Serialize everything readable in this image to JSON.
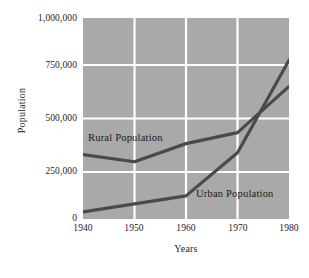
{
  "chart_data": {
    "type": "line",
    "title": "",
    "xlabel": "Years",
    "ylabel": "Population",
    "x": [
      1940,
      1950,
      1960,
      1970,
      1980
    ],
    "xtick_labels": [
      "1940",
      "1950",
      "1960",
      "1970",
      "1980"
    ],
    "xlim": [
      1940,
      1980
    ],
    "ylim": [
      0,
      1000000
    ],
    "ytick_values": [
      1000000,
      750000,
      500000,
      250000,
      0
    ],
    "ytick_labels": [
      "1,000,000",
      "750,000",
      "500,000",
      "250,000",
      "0"
    ],
    "grid": true,
    "grid_color": "#ffffff",
    "plot_background": "#a9a9a9",
    "line_color": "#4a4a4a",
    "legend_position": "inline-annotation",
    "series": [
      {
        "name": "Rural Population",
        "label": "Rural Population",
        "values": [
          320000,
          285000,
          375000,
          430000,
          660000
        ]
      },
      {
        "name": "Urban Population",
        "label": "Urban Population",
        "values": [
          35000,
          75000,
          115000,
          330000,
          790000
        ]
      }
    ],
    "annotations": [
      {
        "text": "Rural Population",
        "x": 1943,
        "y": 430000
      },
      {
        "text": "Urban Population",
        "x": 1965,
        "y": 155000
      }
    ]
  }
}
